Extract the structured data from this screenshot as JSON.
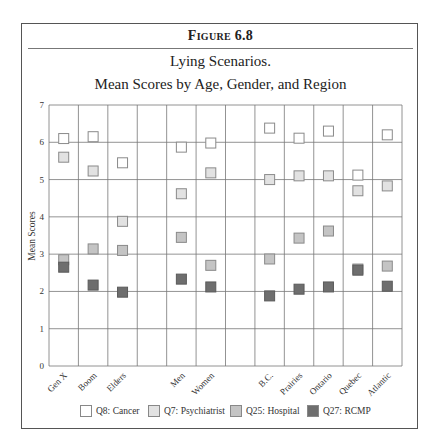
{
  "figure": {
    "label": "Figure 6.8",
    "title_line1": "Lying Scenarios.",
    "title_line2": "Mean Scores by Age, Gender, and Region"
  },
  "colors": {
    "Q8": "#ffffff",
    "Q7": "#e2e2e2",
    "Q25": "#c4c4c4",
    "Q27": "#6e6e6e",
    "grid": "#777777",
    "marker_border": "#8a8a8a"
  },
  "chart_data": {
    "type": "scatter",
    "xlabel": "",
    "ylabel": "Mean Scores",
    "ylim": [
      0,
      7
    ],
    "yticks": [
      0,
      1,
      2,
      3,
      4,
      5,
      6,
      7
    ],
    "grid": true,
    "legend_position": "bottom",
    "columns": [
      "Gen X",
      "Boom",
      "Elders",
      "",
      "Men",
      "Women",
      "",
      "B.C.",
      "Prairies",
      "Ontario",
      "Quebec",
      "Atlantic"
    ],
    "categories": [
      "Gen X",
      "Boom",
      "Elders",
      "Men",
      "Women",
      "B.C.",
      "Prairies",
      "Ontario",
      "Quebec",
      "Atlantic"
    ],
    "series": [
      {
        "name": "Q8: Cancer",
        "key": "Q8",
        "values": [
          6.1,
          6.15,
          5.45,
          5.87,
          5.98,
          6.38,
          6.11,
          6.3,
          5.12,
          6.2
        ]
      },
      {
        "name": "Q7: Psychiatrist",
        "key": "Q7",
        "values": [
          5.6,
          5.23,
          3.88,
          4.62,
          5.18,
          5.0,
          5.1,
          5.1,
          4.7,
          4.83
        ]
      },
      {
        "name": "Q25: Hospital",
        "key": "Q25",
        "values": [
          2.85,
          3.14,
          3.1,
          3.45,
          2.7,
          2.87,
          3.43,
          3.62,
          2.6,
          2.68
        ]
      },
      {
        "name": "Q27: RCMP",
        "key": "Q27",
        "values": [
          2.65,
          2.17,
          1.98,
          2.33,
          2.12,
          1.88,
          2.06,
          2.12,
          2.57,
          2.14
        ]
      }
    ]
  },
  "legend": [
    {
      "label": "Q8: Cancer",
      "key": "Q8"
    },
    {
      "label": "Q7: Psychiatrist",
      "key": "Q7"
    },
    {
      "label": "Q25: Hospital",
      "key": "Q25"
    },
    {
      "label": "Q27: RCMP",
      "key": "Q27"
    }
  ]
}
